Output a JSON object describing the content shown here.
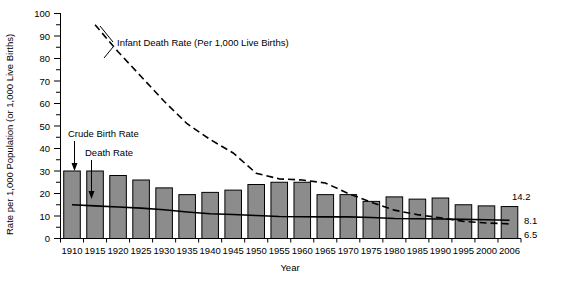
{
  "chart_data": {
    "type": "bar",
    "title": "",
    "xlabel": "Year",
    "ylabel": "Rate per 1,000 Population (or 1,000 Live Births)",
    "ylim": [
      0,
      100
    ],
    "ytick_step": 10,
    "yminor_step": 5,
    "grid": false,
    "legend_position": "inline-annotations",
    "categories": [
      "1910",
      "1915",
      "1920",
      "1925",
      "1930",
      "1935",
      "1940",
      "1945",
      "1950",
      "1955",
      "1960",
      "1965",
      "1970",
      "1975",
      "1980",
      "1985",
      "1990",
      "1995",
      "2000",
      "2006"
    ],
    "series": [
      {
        "name": "Crude Birth Rate",
        "render": "bar",
        "color": "#8c8c8c",
        "values": [
          30.0,
          30.0,
          28.0,
          26.0,
          22.5,
          19.5,
          20.5,
          21.5,
          24.0,
          25.0,
          25.0,
          19.5,
          19.5,
          16.5,
          18.5,
          17.5,
          18.0,
          15.0,
          14.5,
          14.2
        ],
        "end_label": "14.2"
      },
      {
        "name": "Death Rate",
        "render": "solid-line",
        "color": "#000000",
        "values": [
          15.0,
          14.5,
          14.0,
          13.5,
          12.8,
          11.8,
          11.0,
          10.7,
          10.2,
          9.8,
          9.7,
          9.6,
          9.6,
          9.3,
          8.9,
          8.8,
          8.7,
          8.5,
          8.3,
          8.1
        ],
        "end_label": "8.1"
      },
      {
        "name": "Infant Death Rate (Per 1,000 Live Births)",
        "render": "dashed-line",
        "color": "#000000",
        "x_start": "1913",
        "values": [
          null,
          95.0,
          83.0,
          72.0,
          61.0,
          51.0,
          44.0,
          38.0,
          29.0,
          26.5,
          26.0,
          24.7,
          20.0,
          16.1,
          12.6,
          10.6,
          9.2,
          7.6,
          6.9,
          6.5
        ],
        "end_label": "6.5"
      }
    ],
    "annotations": [
      {
        "name": "infant-death-rate-label",
        "text": "Infant Death Rate (Per 1,000 Live Births)",
        "x": 117,
        "y": 43
      },
      {
        "name": "crude-birth-rate-label",
        "text": "Crude Birth Rate",
        "x": 68,
        "y": 134
      },
      {
        "name": "death-rate-label",
        "text": "Death Rate",
        "x": 85,
        "y": 153
      }
    ],
    "ytick_labels": [
      "0",
      "10",
      "20",
      "30",
      "40",
      "50",
      "60",
      "70",
      "80",
      "90",
      "100"
    ],
    "end_labels": [
      "14.2",
      "8.1",
      "6.5"
    ]
  },
  "axis": {
    "y_title": "Rate per 1,000 Population (or 1,000 Live Births)",
    "x_title": "Year"
  },
  "ylabels": {
    "v100": "100",
    "v90": "90",
    "v80": "80",
    "v70": "70",
    "v60": "60",
    "v50": "50",
    "v40": "40",
    "v30": "30",
    "v20": "20",
    "v10": "10",
    "v0": "0"
  },
  "xlabels": {
    "y1910": "1910",
    "y1915": "1915",
    "y1920": "1920",
    "y1925": "1925",
    "y1930": "1930",
    "y1935": "1935",
    "y1940": "1940",
    "y1945": "1945",
    "y1950": "1950",
    "y1955": "1955",
    "y1960": "1960",
    "y1965": "1965",
    "y1970": "1970",
    "y1975": "1975",
    "y1980": "1980",
    "y1985": "1985",
    "y1990": "1990",
    "y1995": "1995",
    "y2000": "2000",
    "y2006": "2006"
  },
  "annot_text": {
    "infant": "Infant Death Rate (Per 1,000 Live Births)",
    "crude": "Crude Birth Rate",
    "death": "Death Rate"
  },
  "endlabels": {
    "birth": "14.2",
    "death": "8.1",
    "infant": "6.5"
  }
}
